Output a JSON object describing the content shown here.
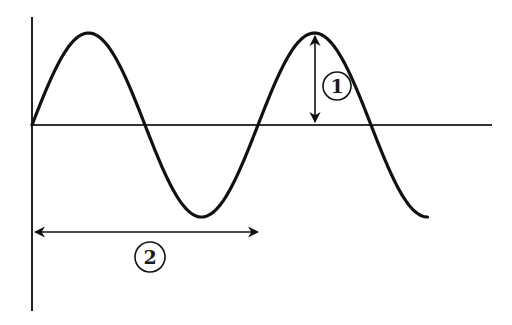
{
  "diagram": {
    "title": "",
    "wave": {
      "cycles_shown": 1.75,
      "start_phase": "zero-crossing rising",
      "color": "#111111"
    },
    "axes": {
      "color": "#222222"
    },
    "markers": [
      {
        "id": "1",
        "label": "1",
        "meaning": "amplitude",
        "orientation": "vertical",
        "from": "equilibrium line",
        "to": "crest"
      },
      {
        "id": "2",
        "label": "2",
        "meaning": "wavelength",
        "orientation": "horizontal",
        "from": "start",
        "to": "one full cycle"
      }
    ]
  }
}
